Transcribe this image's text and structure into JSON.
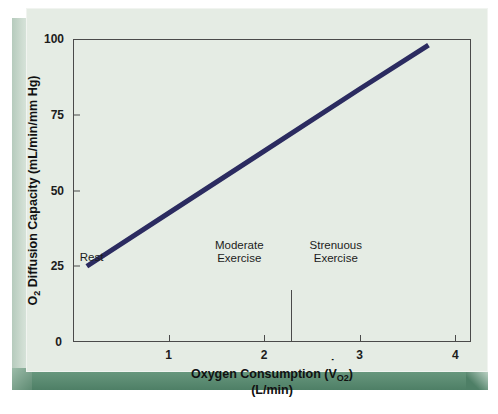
{
  "chart_data": {
    "type": "line",
    "title": "",
    "xlabel": "Oxygen Consumption (VO2)",
    "xlabel_line1_pre": "Oxygen Consumption (",
    "xlabel_v": "V",
    "xlabel_sub": "O",
    "xlabel_sub2": "2",
    "xlabel_line1_post": ")",
    "xlabel_line2": "(L/min)",
    "ylabel": "O2 Diffusion Capacity (mL/min/mm Hg)",
    "ylabel_pre": "O",
    "ylabel_sub": "2",
    "ylabel_post": " Diffusion Capacity (mL/min/mm Hg)",
    "xlim": [
      0,
      4.165
    ],
    "ylim": [
      0,
      100
    ],
    "xticks": [
      1,
      2,
      3,
      4
    ],
    "xtick_labels": [
      "1",
      "2",
      "3",
      "4"
    ],
    "yticks": [
      25,
      50,
      75,
      100
    ],
    "ytick_labels": [
      "25",
      "50",
      "75",
      "100"
    ],
    "y_origin_label": "0",
    "grid": false,
    "legend": "none",
    "line_color": "#2b2b60",
    "line_width_px": 5,
    "series": [
      {
        "name": "O2 diffusion capacity vs oxygen consumption",
        "x": [
          0.145,
          3.72
        ],
        "values": [
          25,
          98
        ],
        "points": [
          {
            "x": 0.145,
            "y": 25
          },
          {
            "x": 1.0,
            "y": 42.5
          },
          {
            "x": 2.0,
            "y": 63.0
          },
          {
            "x": 3.0,
            "y": 83.5
          },
          {
            "x": 3.72,
            "y": 98
          }
        ]
      }
    ],
    "annotations": [
      {
        "name": "rest",
        "text": "Rest",
        "x": 0.07,
        "y": 30,
        "align": "left"
      },
      {
        "name": "moderate-exercise",
        "text_line1": "Moderate",
        "text_line2": "Exercise",
        "x": 1.74,
        "y": 34,
        "align": "center"
      },
      {
        "name": "strenuous-exercise",
        "text_line1": "Strenuous",
        "text_line2": "Exercise",
        "x": 2.75,
        "y": 34,
        "align": "center"
      }
    ],
    "dividers": [
      {
        "name": "moderate-strenuous-divider",
        "x": 2.28,
        "y_from": 0,
        "y_to": 17
      }
    ]
  },
  "style": {
    "panel_background": "#e5ece4",
    "panel_bevel_dark": "#4e7f66",
    "axis_color": "#4a4a4a",
    "text_color": "#1c1c1c"
  }
}
